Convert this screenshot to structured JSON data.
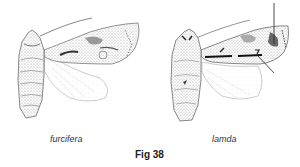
{
  "figure": {
    "label": "Fig 38",
    "specimens": [
      {
        "name": "furcifera",
        "position": "left"
      },
      {
        "name": "lamda",
        "position": "right",
        "annotations": [
          "vertical pointer line to forewing outer area",
          "diagonal pointer line to forewing stigma"
        ]
      }
    ]
  },
  "colors": {
    "ink": "#222222",
    "stipple": "#777777",
    "wash": "#bbbbbb",
    "background": "#ffffff"
  }
}
